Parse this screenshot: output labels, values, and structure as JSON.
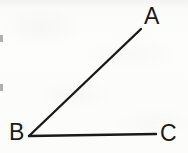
{
  "figure": {
    "kind": "geometry-diagram",
    "canvas": {
      "width": 188,
      "height": 153
    },
    "colors": {
      "background": "#fdfdfc",
      "stroke": "#1a1a1a",
      "label_text": "#1a1a1a"
    },
    "stroke_width": 2,
    "points": {
      "A": {
        "x": 141,
        "y": 29,
        "label": "A"
      },
      "B": {
        "x": 29,
        "y": 136,
        "label": "B"
      },
      "C": {
        "x": 156,
        "y": 134,
        "label": "C"
      }
    },
    "segments": [
      {
        "name": "BA",
        "from": "B",
        "to": "A",
        "x1": 29,
        "y1": 136,
        "x2": 141,
        "y2": 29
      },
      {
        "name": "BC",
        "from": "B",
        "to": "C",
        "x1": 29,
        "y1": 136,
        "x2": 156,
        "y2": 134
      }
    ],
    "labels": {
      "A": "A",
      "B": "B",
      "C": "C"
    },
    "angle_arc_shown": false
  }
}
